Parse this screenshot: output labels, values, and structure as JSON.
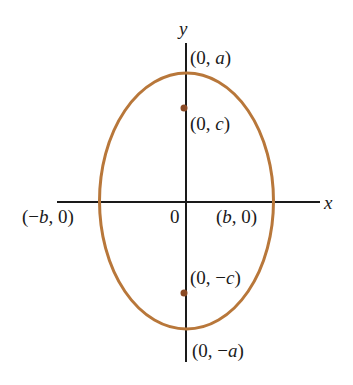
{
  "diagram": {
    "type": "ellipse-vertical-major-axis",
    "colors": {
      "ellipse": "#b8773a",
      "focus": "#8a4a25",
      "axis": "#1a1a1a"
    },
    "axes": {
      "x_label": "x",
      "y_label": "y",
      "origin_label": "0"
    },
    "points": {
      "top_vertex": {
        "open": "(0, ",
        "var": "a",
        "close": ")"
      },
      "upper_focus": {
        "open": "(0, ",
        "var": "c",
        "close": ")"
      },
      "left_vertex": {
        "open": "(−",
        "var": "b",
        "close": ", 0)"
      },
      "right_vertex": {
        "open": "(",
        "var": "b",
        "close": ", 0)"
      },
      "lower_focus": {
        "open": "(0, −",
        "var": "c",
        "close": ")"
      },
      "bottom_vertex": {
        "open": "(0, −",
        "var": "a",
        "close": ")"
      }
    }
  }
}
